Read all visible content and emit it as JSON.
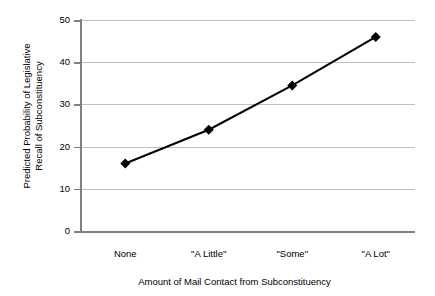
{
  "chart_data": {
    "type": "line",
    "title": "",
    "xlabel": "Amount of Mail Contact from Subconstituency",
    "ylabel": "Predicted Probability of Legislative Recall of Subconstituency",
    "ylabel_lines": [
      "Predicted Probability of Legislative",
      "Recall of Subconstituency"
    ],
    "categories": [
      "None",
      "\"A Little\"",
      "\"Some\"",
      "\"A Lot\""
    ],
    "values": [
      16,
      24,
      34.5,
      46
    ],
    "series": [
      {
        "name": "Predicted Probability",
        "values": [
          16,
          24,
          34.5,
          46
        ]
      }
    ],
    "ylim": [
      0,
      50
    ],
    "yticks": [
      0,
      10,
      20,
      30,
      40,
      50
    ],
    "ytick_labels": [
      "0",
      "10",
      "20",
      "30",
      "40",
      "50"
    ],
    "grid": true,
    "grid_axis": "y",
    "legend": false,
    "legend_position": "none",
    "marker": "diamond",
    "marker_color": "#000000",
    "line_color": "#000000",
    "gridline_color": "#bfbfbf",
    "axis_color": "#7f7f7f",
    "background": "#ffffff"
  }
}
